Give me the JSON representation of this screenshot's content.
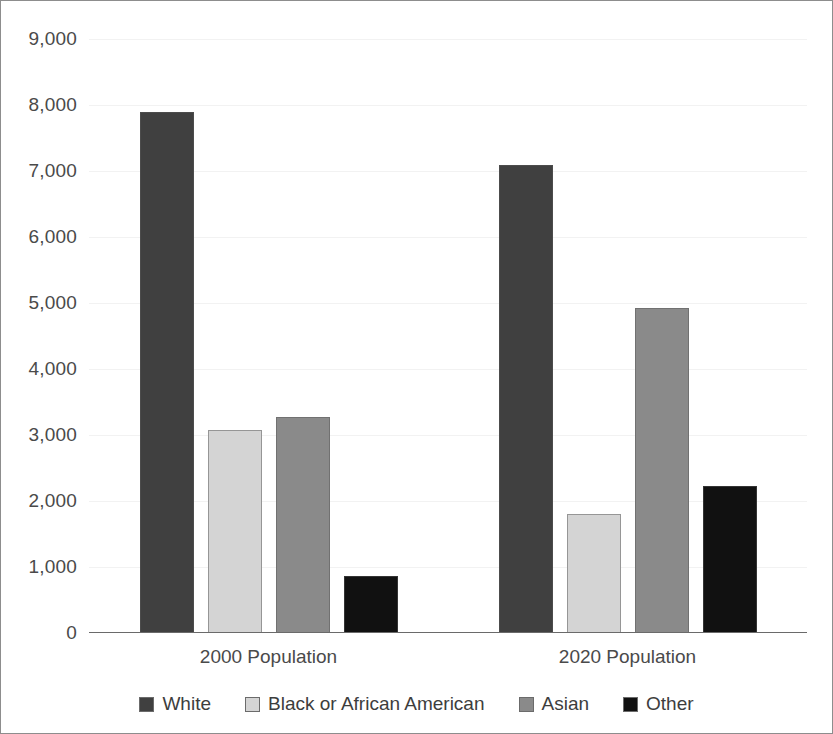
{
  "chart_data": {
    "type": "bar",
    "title": "",
    "xlabel": "",
    "ylabel": "",
    "categories": [
      "2000 Population",
      "2020 Population"
    ],
    "series": [
      {
        "name": "White",
        "color": "#404040",
        "values": [
          7900,
          7090
        ]
      },
      {
        "name": "Black or African American",
        "color": "#d4d4d4",
        "values": [
          3080,
          1810
        ]
      },
      {
        "name": "Asian",
        "color": "#8a8a8a",
        "values": [
          3280,
          4930
        ]
      },
      {
        "name": "Other",
        "color": "#111111",
        "values": [
          860,
          2220
        ]
      }
    ],
    "ylim": [
      0,
      9000
    ],
    "y_ticks": [
      0,
      1000,
      2000,
      3000,
      4000,
      5000,
      6000,
      7000,
      8000,
      9000
    ],
    "y_tick_labels": [
      "0",
      "1,000",
      "2,000",
      "3,000",
      "4,000",
      "5,000",
      "6,000",
      "7,000",
      "8,000",
      "9,000"
    ],
    "grid": true,
    "legend_position": "bottom"
  },
  "frame": {
    "border_color": "#8d8d8d",
    "background": "#ffffff"
  }
}
